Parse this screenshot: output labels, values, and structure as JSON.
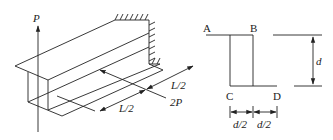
{
  "beam_view": {
    "load_vertical": "P",
    "load_horizontal": "2P",
    "span_segment_1": "L/2",
    "span_segment_2": "L/2"
  },
  "cross_section": {
    "point_a": "A",
    "point_b": "B",
    "point_c": "C",
    "point_d": "D",
    "height_dim": "d",
    "width_dim_left": "d/2",
    "width_dim_right": "d/2"
  },
  "colors": {
    "line": "#222222",
    "background": "#ffffff"
  }
}
